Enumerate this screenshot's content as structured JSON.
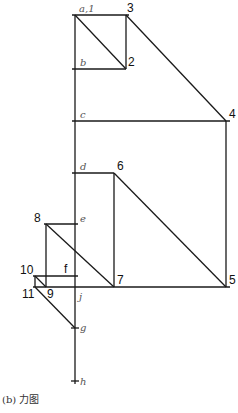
{
  "figure": {
    "caption": "(b) 力图",
    "labels": {
      "a1": "a,1",
      "b": "b",
      "c": "c",
      "d": "d",
      "e": "e",
      "f": "f",
      "g": "g",
      "h": "h",
      "j": "j",
      "n2": "2",
      "n3": "3",
      "n4": "4",
      "n5": "5",
      "n6": "6",
      "n7": "7",
      "n8": "8",
      "n9": "9",
      "n10": "10",
      "n11": "11"
    },
    "points": {
      "a": [
        75,
        15
      ],
      "b": [
        75,
        69
      ],
      "c": [
        75,
        121
      ],
      "d": [
        75,
        173
      ],
      "e": [
        75,
        224
      ],
      "f": [
        75,
        276
      ],
      "j": [
        75,
        287
      ],
      "g": [
        75,
        328
      ],
      "h": [
        75,
        381
      ],
      "2": [
        126,
        69
      ],
      "3": [
        126,
        15
      ],
      "4": [
        226,
        121
      ],
      "5": [
        226,
        287
      ],
      "6": [
        114,
        173
      ],
      "7": [
        114,
        287
      ],
      "8": [
        46,
        224
      ],
      "9": [
        46,
        287
      ],
      "10": [
        35,
        276
      ],
      "11": [
        35,
        287
      ]
    }
  }
}
